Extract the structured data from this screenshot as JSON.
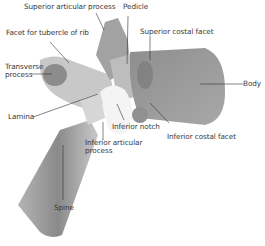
{
  "diagram": {
    "labels": [
      {
        "id": "superior-articular-process",
        "text": "Superior articular process"
      },
      {
        "id": "pedicle",
        "text": "Pedicle"
      },
      {
        "id": "facet-tubercle-rib",
        "text": "Facet for tubercle of rib"
      },
      {
        "id": "superior-costal-facet",
        "text": "Superior costal facet"
      },
      {
        "id": "transverse-process",
        "text": "Transverse process",
        "line1": "Transverse",
        "line2": "process"
      },
      {
        "id": "body",
        "text": "Body"
      },
      {
        "id": "lamina",
        "text": "Lamina"
      },
      {
        "id": "inferior-notch",
        "text": "Inferior notch"
      },
      {
        "id": "inferior-costal-facet",
        "text": "Inferior costal facet"
      },
      {
        "id": "inferior-articular-process",
        "text": "Inferior articular process",
        "line1": "Inferior articular",
        "line2": "process"
      },
      {
        "id": "spine",
        "text": "Spine"
      }
    ],
    "colors": {
      "bone_dark": "#7d7d7d",
      "bone_mid": "#a5a5a5",
      "bone_light": "#d8d8d8",
      "leader": "#333333",
      "text": "#3a3a3a"
    }
  }
}
